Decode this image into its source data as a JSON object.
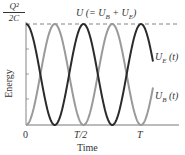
{
  "chart_data": {
    "type": "line",
    "title": "",
    "xlabel": "Time",
    "ylabel": "Energy",
    "x_ticks": [
      "0",
      "T/2",
      "T"
    ],
    "y_max_label": {
      "numerator": "Q²",
      "denominator": "2C"
    },
    "total_label": "U (= U_B + U_E)",
    "ylim": [
      0,
      1
    ],
    "xlim_periods": [
      0,
      1.2
    ],
    "series": [
      {
        "name": "U_E(t)",
        "label": "U_E (t)",
        "formula": "cos²(2πt/T)",
        "color": "#2b2b2b",
        "start_value": 1
      },
      {
        "name": "U_B(t)",
        "label": "U_B (t)",
        "formula": "sin²(2πt/T)",
        "color": "#9a9a9a",
        "start_value": 0
      },
      {
        "name": "U",
        "label": "U (= U_B + U_E)",
        "formula": "constant = Q²/2C",
        "color": "#777777",
        "style": "dashed"
      }
    ],
    "grid": false,
    "legend_position": "inline-right"
  },
  "labels": {
    "y_num": "Q²",
    "y_den": "2C",
    "total_prefix": "U (= U",
    "total_sub_b": "B",
    "total_mid": "+ U",
    "total_sub_e": "E",
    "total_suffix": ")",
    "ue_main": "U",
    "ue_sub": "E",
    "ue_arg": " (t)",
    "ub_main": "U",
    "ub_sub": "B",
    "ub_arg": " (t)",
    "energy": "Energy",
    "time": "Time",
    "tick_0": "0",
    "tick_half": "T/2",
    "tick_T": "T"
  }
}
